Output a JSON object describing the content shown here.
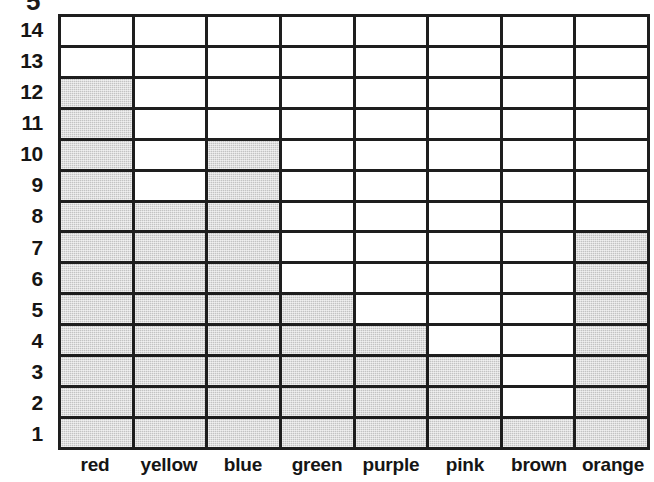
{
  "clipped_top_glyph": "5",
  "chart_data": {
    "type": "bar",
    "title": "",
    "subtitle": "",
    "xlabel": "",
    "ylabel": "",
    "orientation": "vertical",
    "grid": true,
    "legend": null,
    "legend_position": "none",
    "style": "filled-grid-squares",
    "fill_color": "#c3c3c3",
    "empty_color": "#ffffff",
    "grid_line_color": "#1e1e1e",
    "categories": [
      "red",
      "yellow",
      "blue",
      "green",
      "purple",
      "pink",
      "brown",
      "orange"
    ],
    "values": [
      12,
      8,
      10,
      5,
      4,
      3,
      1,
      7
    ],
    "y_ticks": [
      14,
      13,
      12,
      11,
      10,
      9,
      8,
      7,
      6,
      5,
      4,
      3,
      2,
      1
    ],
    "ylim": [
      0,
      14
    ],
    "rows": 14,
    "columns": 8,
    "annotations": []
  }
}
